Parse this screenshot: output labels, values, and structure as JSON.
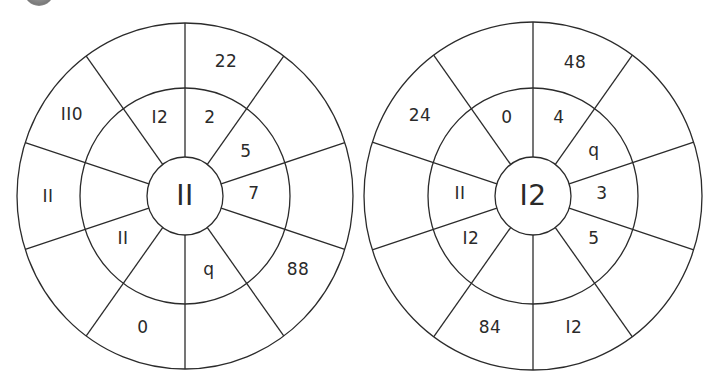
{
  "badge": {
    "color": "#8a8a8a"
  },
  "colors": {
    "line": "#2b2b2b",
    "text": "#2a2a2a",
    "background": "#ffffff"
  },
  "wheels": [
    {
      "center": "II",
      "geometry": {
        "cx": 185,
        "cy": 196,
        "r_outer_x": 168,
        "r_outer_y": 173,
        "r_mid_x": 105,
        "r_mid_y": 108,
        "r_inner_x": 38,
        "r_inner_y": 39
      },
      "middle_ring": [
        {
          "text": "2",
          "x": 210,
          "y": 117
        },
        {
          "text": "5",
          "x": 246,
          "y": 151
        },
        {
          "text": "7",
          "x": 254,
          "y": 193
        },
        {
          "text": "q",
          "x": 209,
          "y": 269
        },
        {
          "text": "II",
          "x": 123,
          "y": 238
        },
        {
          "text": "I2",
          "x": 160,
          "y": 117
        }
      ],
      "outer_ring": [
        {
          "text": "22",
          "x": 226,
          "y": 61
        },
        {
          "text": "88",
          "x": 298,
          "y": 269
        },
        {
          "text": "0",
          "x": 143,
          "y": 327
        },
        {
          "text": "II",
          "x": 48,
          "y": 196
        },
        {
          "text": "II0",
          "x": 72,
          "y": 114
        }
      ]
    },
    {
      "center": "I2",
      "geometry": {
        "cx": 533,
        "cy": 196,
        "r_outer_x": 169,
        "r_outer_y": 174,
        "r_mid_x": 105,
        "r_mid_y": 108,
        "r_inner_x": 38,
        "r_inner_y": 39
      },
      "middle_ring": [
        {
          "text": "4",
          "x": 559,
          "y": 117
        },
        {
          "text": "q",
          "x": 594,
          "y": 150
        },
        {
          "text": "3",
          "x": 602,
          "y": 193
        },
        {
          "text": "5",
          "x": 594,
          "y": 238
        },
        {
          "text": "I2",
          "x": 471,
          "y": 238
        },
        {
          "text": "II",
          "x": 460,
          "y": 193
        },
        {
          "text": "0",
          "x": 507,
          "y": 117
        }
      ],
      "outer_ring": [
        {
          "text": "48",
          "x": 575,
          "y": 62
        },
        {
          "text": "I2",
          "x": 574,
          "y": 327
        },
        {
          "text": "84",
          "x": 490,
          "y": 327
        },
        {
          "text": "24",
          "x": 420,
          "y": 115
        }
      ]
    }
  ]
}
